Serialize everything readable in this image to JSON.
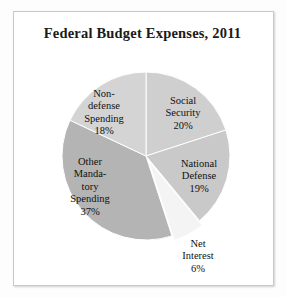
{
  "chart_data": {
    "type": "pie",
    "title": "Federal Budget Expenses, 2011",
    "xlabel": "",
    "ylabel": "",
    "legend": "none",
    "grid": false,
    "start_angle_deg": 90,
    "direction": "clockwise",
    "categories": [
      "Social Security",
      "National Defense",
      "Net Interest",
      "Other Mandatory Spending",
      "Non-defense Spending"
    ],
    "values": [
      20,
      19,
      6,
      37,
      18
    ],
    "units": "percent",
    "slices": [
      {
        "name": "Social Security",
        "label_text": "Social\nSecurity\n20%",
        "value": 20,
        "color": "#cfcfcf",
        "exploded": false
      },
      {
        "name": "National Defense",
        "label_text": "National\nDefense\n19%",
        "value": 19,
        "color": "#c9c9c9",
        "exploded": false
      },
      {
        "name": "Net Interest",
        "label_text": "Net\nInterest\n6%",
        "value": 6,
        "color": "#f4f4f4",
        "exploded": true
      },
      {
        "name": "Other Mandatory Spending",
        "label_text": "Other\nManda-\ntory\nSpending\n37%",
        "value": 37,
        "color": "#b4b4b4",
        "exploded": false
      },
      {
        "name": "Non-defense Spending",
        "label_text": "Non-\ndefense\nSpending\n18%",
        "value": 18,
        "color": "#d4d4d4",
        "exploded": false
      }
    ]
  },
  "figure": {
    "background_color": "#ffffff",
    "border_color": "#c9c9c9",
    "text_color": "#111111"
  }
}
